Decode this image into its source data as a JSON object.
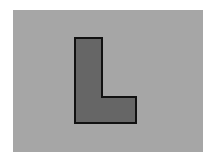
{
  "diagram": {
    "background_color": "#a6a6a6",
    "shape": {
      "name": "L",
      "fill_color": "#666666",
      "stroke_color": "#111111",
      "points": [
        [
          75,
          38
        ],
        [
          102,
          38
        ],
        [
          102,
          97
        ],
        [
          136,
          97
        ],
        [
          136,
          123
        ],
        [
          75,
          123
        ]
      ]
    }
  }
}
